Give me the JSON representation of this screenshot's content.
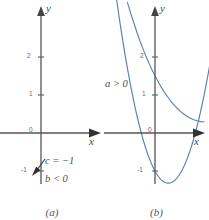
{
  "figure": {
    "panels": [
      {
        "id": "a",
        "caption": "(a)",
        "axis_x_label": "x",
        "axis_y_label": "y",
        "tick_labels": [
          "2",
          "1",
          "0",
          "-1"
        ],
        "notes": [
          "c = −1",
          "b < 0"
        ],
        "curve": "none",
        "axis_color": "#555555",
        "text_color": "#4f4f4f"
      },
      {
        "id": "b",
        "caption": "(b)",
        "axis_x_label": "x",
        "axis_y_label": "y",
        "tick_labels": [
          "2",
          "1",
          "0",
          "-1"
        ],
        "notes": [
          "a > 0"
        ],
        "curve": "parabola",
        "axis_color": "#555555",
        "text_color": "#4f4f4f",
        "curve_color": "#5a7fae"
      }
    ]
  },
  "chart_data": {
    "type": "line",
    "title": "",
    "xlabel": "x",
    "ylabel": "y",
    "grid": false,
    "legend": "none",
    "panels": [
      {
        "label": "(a)",
        "annotations": [
          "c = −1",
          "b < 0"
        ],
        "xlim": [
          -1.1,
          1.6
        ],
        "ylim": [
          -1.7,
          2.6
        ],
        "yticks": [
          2,
          1,
          0,
          -1
        ],
        "xticks": [],
        "series": [],
        "marked_points": [
          {
            "x": 0,
            "y": -1,
            "label": "c = −1"
          }
        ]
      },
      {
        "label": "(b)",
        "annotations": [
          "a > 0"
        ],
        "xlim": [
          -1.35,
          1.45
        ],
        "ylim": [
          -1.7,
          2.6
        ],
        "yticks": [
          2,
          1,
          0,
          -1
        ],
        "xticks": [],
        "series": [
          {
            "name": "y = a x^2 + b x + c, a > 0",
            "vertex": {
              "x": 0.35,
              "y": -1.32
            },
            "y_intercept": -1,
            "x": [
              -1.3,
              -1.1,
              -0.9,
              -0.7,
              -0.5,
              -0.3,
              -0.1,
              0.1,
              0.35,
              0.6,
              0.8,
              1.0,
              1.2,
              1.4
            ],
            "y": [
              4.55,
              3.11,
              1.88,
              0.87,
              0.08,
              -0.5,
              -0.86,
              -1.1,
              -1.32,
              -1.1,
              -0.77,
              -0.32,
              0.25,
              0.93
            ]
          }
        ]
      }
    ]
  }
}
